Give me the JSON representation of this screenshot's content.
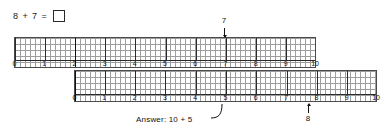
{
  "problem": {
    "left_operand": "8",
    "plus": "+",
    "right_operand": "7",
    "equals": "=",
    "answer_box_value": ""
  },
  "top_ruler": {
    "name": "top-number-line",
    "start_value": 0,
    "end_value": 10,
    "labels": [
      "0",
      "1",
      "2",
      "3",
      "4",
      "5",
      "6",
      "7",
      "8",
      "9",
      "10"
    ],
    "minor_divisions_per_unit": 6,
    "highlighted_value": "2",
    "end_marker_value": "10"
  },
  "bottom_ruler": {
    "name": "bottom-number-line",
    "start_value": 0,
    "end_value": 10,
    "labels": [
      "0",
      "1",
      "2",
      "3",
      "4",
      "5",
      "6",
      "7",
      "8",
      "9",
      "10"
    ],
    "minor_divisions_per_unit": 6,
    "highlighted_value": "0",
    "end_marker_value": "8"
  },
  "annotations": {
    "top_arrow_label": "7",
    "top_arrow_points_to": "7",
    "bottom_arrow_label": "8",
    "bottom_arrow_points_to": "8",
    "answer_text": "Answer: 10 + 5",
    "answer_points_to": "5"
  },
  "colors": {
    "ink": "#111111",
    "grid": "#8d8d8d",
    "rule_border": "#4a4a4a",
    "page": "#ffffff"
  }
}
